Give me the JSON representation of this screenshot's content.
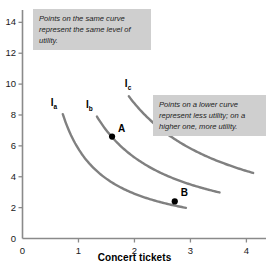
{
  "chart_data": {
    "type": "line",
    "title": "",
    "xlabel": "Concert tickets",
    "ylabel": "",
    "xlim": [
      0,
      4.35
    ],
    "ylim": [
      0,
      14.8
    ],
    "grid": false,
    "legend_position": "inline-curve-labels",
    "x_ticks": [
      "0",
      "1",
      "2",
      "3",
      "4"
    ],
    "x_tick_values": [
      0,
      1,
      2,
      3,
      4
    ],
    "y_ticks": [
      "0",
      "2",
      "4",
      "6",
      "8",
      "10",
      "12",
      "14"
    ],
    "y_tick_values": [
      0,
      2,
      4,
      6,
      8,
      10,
      12,
      14
    ],
    "series": [
      {
        "name": "Ia",
        "label": "I",
        "sublabel": "a",
        "color": "#808080",
        "utility_constant": 5.8,
        "x_start": 0.72,
        "x_end": 2.92,
        "points": [
          [
            0.72,
            8.05
          ],
          [
            0.85,
            6.85
          ],
          [
            1.0,
            5.8
          ],
          [
            1.2,
            4.85
          ],
          [
            1.45,
            4.0
          ],
          [
            1.75,
            3.3
          ],
          [
            2.1,
            2.75
          ],
          [
            2.5,
            2.3
          ],
          [
            2.92,
            2.0
          ]
        ]
      },
      {
        "name": "Ib",
        "label": "I",
        "sublabel": "b",
        "color": "#808080",
        "utility_constant": 10.5,
        "x_start": 1.33,
        "x_end": 3.52,
        "points": [
          [
            1.33,
            9.3
          ],
          [
            1.45,
            8.2
          ],
          [
            1.6,
            6.6
          ],
          [
            1.8,
            5.65
          ],
          [
            2.1,
            4.6
          ],
          [
            2.45,
            3.75
          ],
          [
            2.72,
            2.4
          ],
          [
            3.1,
            2.9
          ],
          [
            3.52,
            2.55
          ]
        ]
      },
      {
        "name": "Ic",
        "label": "I",
        "sublabel": "c",
        "color": "#808080",
        "utility_constant": 17.5,
        "x_start": 1.9,
        "x_end": 4.12,
        "points": [
          [
            1.9,
            10.55
          ],
          [
            2.05,
            9.3
          ],
          [
            2.25,
            8.0
          ],
          [
            2.5,
            6.9
          ],
          [
            2.85,
            5.8
          ],
          [
            3.2,
            5.0
          ],
          [
            3.6,
            4.4
          ],
          [
            4.12,
            3.9
          ]
        ]
      }
    ],
    "marked_points": [
      {
        "name": "A",
        "label": "A",
        "x": 1.6,
        "y": 6.6,
        "curve": "Ib"
      },
      {
        "name": "B",
        "label": "B",
        "x": 2.72,
        "y": 2.4,
        "curve": "Ib"
      }
    ],
    "annotations": [
      {
        "name": "same-curve-note",
        "text": "Points on the same curve represent the same level of utility."
      },
      {
        "name": "lower-curve-note",
        "text": "Points on a lower curve represent less utility; on a higher one, more utility."
      }
    ],
    "colors": {
      "curve": "#808080",
      "axis": "#8a8a8a",
      "annotation_background": "#cfcfcf",
      "text": "#1a1a1a",
      "point": "#000000"
    }
  }
}
